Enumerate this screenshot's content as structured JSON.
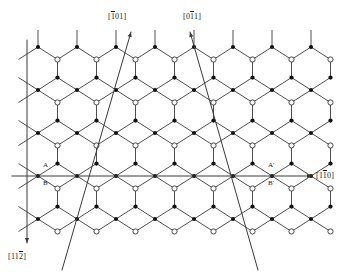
{
  "figure": {
    "type": "crystal-lattice-projection",
    "background_color": "#ffffff",
    "line_color": "#3a3a3a",
    "atom_filled_color": "#111111",
    "atom_open_fill": "#ffffff",
    "atom_open_stroke": "#333333"
  },
  "axes": [
    {
      "id": "axis-vertical",
      "name": "vertical-axis",
      "label_parts": [
        {
          "t": "[",
          "ov": false
        },
        {
          "t": "1",
          "ov": false
        },
        {
          "t": "1",
          "ov": false
        },
        {
          "t": "2",
          "ov": true
        },
        {
          "t": "]",
          "ov": false
        }
      ],
      "label_text": "[112̄]",
      "direction": "down",
      "x1": 27,
      "y1": 40,
      "x2": 27,
      "y2": 243,
      "label_x": 8,
      "label_y": 252
    },
    {
      "id": "axis-horizontal",
      "name": "horizontal-axis",
      "label_parts": [
        {
          "t": "[",
          "ov": false
        },
        {
          "t": "1",
          "ov": false
        },
        {
          "t": "1",
          "ov": true
        },
        {
          "t": "0",
          "ov": false
        },
        {
          "t": "]",
          "ov": false
        }
      ],
      "label_text": "[11̄0]",
      "direction": "right",
      "x1": 12,
      "y1": 176,
      "x2": 312,
      "y2": 176,
      "label_x": 316,
      "label_y": 171
    },
    {
      "id": "axis-diagonal-left",
      "name": "diagonal-axis-101bar",
      "label_parts": [
        {
          "t": "[",
          "ov": false
        },
        {
          "t": "1",
          "ov": true
        },
        {
          "t": "0",
          "ov": false
        },
        {
          "t": "1",
          "ov": false
        },
        {
          "t": "]",
          "ov": false
        }
      ],
      "label_text": "[1̄01]",
      "direction": "up-left",
      "x1": 62,
      "y1": 270,
      "x2": 131,
      "y2": 32,
      "label_x": 108,
      "label_y": 12
    },
    {
      "id": "axis-diagonal-right",
      "name": "diagonal-axis-01bar1",
      "label_parts": [
        {
          "t": "[",
          "ov": false
        },
        {
          "t": "0",
          "ov": false
        },
        {
          "t": "1",
          "ov": true
        },
        {
          "t": "1",
          "ov": false
        },
        {
          "t": "]",
          "ov": false
        }
      ],
      "label_text": "[01̄1]",
      "direction": "up-right",
      "x1": 258,
      "y1": 270,
      "x2": 190,
      "y2": 32,
      "label_x": 183,
      "label_y": 12
    }
  ],
  "point_labels": [
    {
      "id": "label-A",
      "text": "A",
      "x": 43,
      "y": 161,
      "name": "site-label-a"
    },
    {
      "id": "label-B",
      "text": "B",
      "x": 43,
      "y": 179,
      "name": "site-label-b"
    },
    {
      "id": "label-Ap",
      "text": "A'",
      "x": 268,
      "y": 161,
      "name": "site-label-a-prime"
    },
    {
      "id": "label-Bp",
      "text": "B'",
      "x": 268,
      "y": 179,
      "name": "site-label-b-prime"
    }
  ],
  "lattice": {
    "origin_x": 38,
    "origin_y": 47,
    "hex_width": 39,
    "row_height": 43,
    "columns": 7,
    "rows": 4,
    "stub_length": 17,
    "atom_radius_filled": 2.1,
    "atom_radius_open": 2.6
  }
}
